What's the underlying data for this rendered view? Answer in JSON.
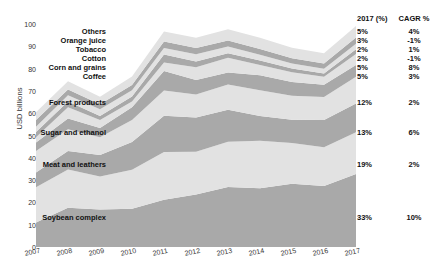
{
  "chart_data": {
    "type": "area",
    "title": "",
    "xlabel": "",
    "ylabel": "USD billions",
    "ylim": [
      0,
      100
    ],
    "grid": false,
    "legend_position": "right-inline-labels",
    "stacked": true,
    "x": [
      2007,
      2008,
      2009,
      2010,
      2011,
      2012,
      2013,
      2014,
      2015,
      2016,
      2017
    ],
    "xtick_labels": [
      "2007",
      "2008",
      "2009",
      "2010",
      "2011",
      "2012",
      "2013",
      "2014",
      "2015",
      "2016",
      "2017"
    ],
    "ytick_labels": [
      "0",
      "10",
      "20",
      "30",
      "40",
      "50",
      "60",
      "70",
      "80",
      "90",
      "100"
    ],
    "ytick_values": [
      0,
      10,
      20,
      30,
      40,
      50,
      60,
      70,
      80,
      90,
      100
    ],
    "series": [
      {
        "name": "Soybean complex",
        "share_2017": "33%",
        "cagr": "10%",
        "values": [
          11.0,
          17.6,
          16.8,
          17.1,
          21.2,
          23.5,
          26.9,
          26.3,
          28.4,
          27.3,
          32.7
        ]
      },
      {
        "name": "Meat and leathers",
        "share_2017": "19%",
        "cagr": "2%",
        "values": [
          15.8,
          17.2,
          14.8,
          17.5,
          21.4,
          19.2,
          20.3,
          21.3,
          18.2,
          17.4,
          18.8
        ]
      },
      {
        "name": "Sugar and ethanol",
        "share_2017": "13%",
        "cagr": "6%",
        "values": [
          6.6,
          8.2,
          9.6,
          12.5,
          16.3,
          15.4,
          14.3,
          11.2,
          10.5,
          12.3,
          12.9
        ]
      },
      {
        "name": "Forest products",
        "share_2017": "12%",
        "cagr": "2%",
        "values": [
          9.6,
          9.8,
          8.0,
          9.8,
          11.3,
          10.3,
          11.4,
          11.5,
          10.7,
          10.3,
          11.9
        ]
      },
      {
        "name": "Coffee",
        "share_2017": "5%",
        "cagr": "3%",
        "values": [
          3.9,
          4.8,
          4.2,
          5.8,
          8.7,
          6.5,
          5.4,
          6.7,
          6.2,
          5.5,
          5.3
        ]
      },
      {
        "name": "Corn and grains",
        "share_2017": "5%",
        "cagr": "8%",
        "values": [
          2.3,
          5.1,
          3.6,
          2.6,
          3.8,
          5.7,
          6.6,
          4.6,
          4.4,
          3.5,
          5.0
        ]
      },
      {
        "name": "Cotton",
        "share_2017": "2%",
        "cagr": "-1%",
        "values": [
          2.4,
          2.5,
          1.8,
          2.2,
          3.6,
          2.6,
          2.0,
          2.0,
          1.6,
          1.5,
          2.1
        ]
      },
      {
        "name": "Tobacco",
        "share_2017": "2%",
        "cagr": "1%",
        "values": [
          2.3,
          2.8,
          3.0,
          2.8,
          2.9,
          3.2,
          3.0,
          2.6,
          2.3,
          2.1,
          2.4
        ]
      },
      {
        "name": "Orange juice",
        "share_2017": "3%",
        "cagr": "-1%",
        "values": [
          3.1,
          2.6,
          2.2,
          2.3,
          2.9,
          2.8,
          2.7,
          2.6,
          2.3,
          2.4,
          2.9
        ]
      },
      {
        "name": "Others",
        "share_2017": "5%",
        "cagr": "4%",
        "values": [
          3.4,
          3.7,
          3.4,
          3.9,
          4.5,
          4.6,
          5.1,
          5.0,
          4.8,
          4.6,
          5.1
        ]
      }
    ],
    "colors": {
      "band_dark": "#a9a9a9",
      "band_light": "#e2e2e2",
      "text": "#1a1a1a",
      "background": "#ffffff"
    }
  },
  "axes": {
    "y_title": "USD billions",
    "y_ticks": [
      "100",
      "90",
      "80",
      "70",
      "60",
      "50",
      "40",
      "30",
      "20",
      "10",
      "0"
    ],
    "x_ticks": [
      "2007",
      "2008",
      "2009",
      "2010",
      "2011",
      "2012",
      "2013",
      "2014",
      "2015",
      "2016",
      "2017"
    ]
  },
  "legend": {
    "header": {
      "share": "2017 (%)",
      "cagr": "CAGR %"
    },
    "rows": [
      {
        "label": "Others",
        "share": "5%",
        "cagr": "4%"
      },
      {
        "label": "Orange juice",
        "share": "3%",
        "cagr": "-1%"
      },
      {
        "label": "Tobacco",
        "share": "2%",
        "cagr": "1%"
      },
      {
        "label": "Cotton",
        "share": "2%",
        "cagr": "-1%"
      },
      {
        "label": "Corn and grains",
        "share": "5%",
        "cagr": "8%"
      },
      {
        "label": "Coffee",
        "share": "5%",
        "cagr": "3%"
      },
      {
        "label": "Forest products",
        "share": "12%",
        "cagr": "2%"
      },
      {
        "label": "Sugar and ethanol",
        "share": "13%",
        "cagr": "6%"
      },
      {
        "label": "Meat and leathers",
        "share": "19%",
        "cagr": "2%"
      },
      {
        "label": "Soybean complex",
        "share": "33%",
        "cagr": "10%"
      }
    ]
  }
}
